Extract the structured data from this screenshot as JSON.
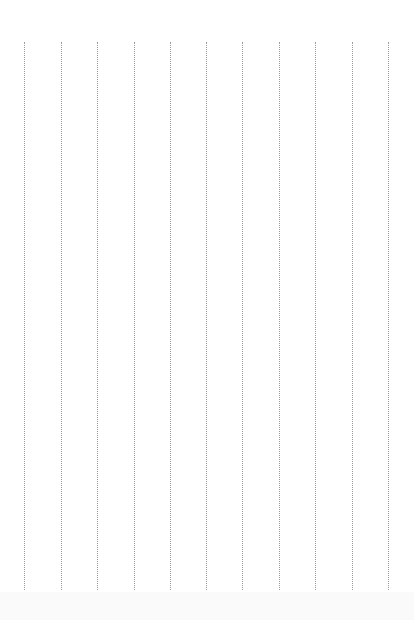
{
  "page": {
    "type": "ruled-paper",
    "orientation": "vertical-lines",
    "line_style": "dotted",
    "line_color": "#9a9a9a",
    "background": "#ffffff",
    "line_count": 11,
    "line_positions_x": [
      24,
      61,
      97,
      134,
      170,
      206,
      242,
      279,
      315,
      352,
      388
    ],
    "line_top_y": 42,
    "line_bottom_y": 590
  }
}
